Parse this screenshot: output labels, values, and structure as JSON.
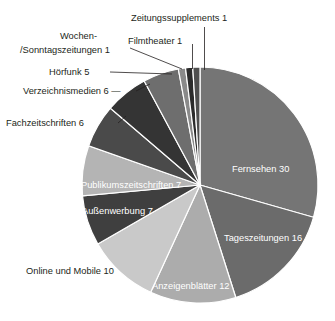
{
  "chart_data": {
    "type": "pie",
    "title": "",
    "subtitle": "",
    "xlabel": "",
    "ylabel": "",
    "total": 102,
    "legend_position": "none",
    "grid": false,
    "label_format": "name value",
    "start_angle_deg": 0,
    "direction": "clockwise",
    "categories": [
      "Fernsehen",
      "Tageszeitungen",
      "Anzeigenblätter",
      "Online und Mobile",
      "Außenwerbung",
      "Publikumszeitschriften",
      "Fachzeitschriften",
      "Verzeichnismedien",
      "Hörfunk",
      "Wochen-/Sonntagszeitungen",
      "Filmtheater",
      "Zeitungssupplements"
    ],
    "values": [
      30,
      16,
      12,
      10,
      7,
      7,
      6,
      6,
      5,
      1,
      1,
      1
    ],
    "slices": [
      {
        "name": "Fernsehen",
        "value": 30,
        "label": "Fernsehen 30",
        "color": "#757575",
        "label_placement": "inside",
        "label_color": "#ffffff"
      },
      {
        "name": "Tageszeitungen",
        "value": 16,
        "label": "Tageszeitungen 16",
        "color": "#6b6b6b",
        "label_placement": "inside",
        "label_color": "#ffffff"
      },
      {
        "name": "Anzeigenblätter",
        "value": 12,
        "label": "Anzeigenblätter 12",
        "color": "#acacac",
        "label_placement": "inside",
        "label_color": "#ffffff"
      },
      {
        "name": "Online und Mobile",
        "value": 10,
        "label": "Online und Mobile 10",
        "color": "#c9c9c9",
        "label_placement": "outside",
        "label_color": "#231f20"
      },
      {
        "name": "Außenwerbung",
        "value": 7,
        "label": "Außenwerbung 7",
        "color": "#3f3f3f",
        "label_placement": "inside",
        "label_color": "#ffffff"
      },
      {
        "name": "Publikumszeitschriften",
        "value": 7,
        "label": "Publikumszeitschriften 7",
        "color": "#b4b4b4",
        "label_placement": "inside",
        "label_color": "#ffffff"
      },
      {
        "name": "Fachzeitschriften",
        "value": 6,
        "label": "Fachzeitschriften 6",
        "color": "#4a4a4a",
        "label_placement": "outside",
        "label_color": "#231f20"
      },
      {
        "name": "Verzeichnismedien",
        "value": 6,
        "label": "Verzeichnismedien 6",
        "color": "#343434",
        "label_placement": "outside",
        "label_color": "#231f20"
      },
      {
        "name": "Hörfunk",
        "value": 5,
        "label": "Hörfunk 5",
        "color": "#6e6e6e",
        "label_placement": "outside",
        "label_color": "#231f20"
      },
      {
        "name": "Wochen-/Sonntagszeitungen",
        "value": 1,
        "label": "Wochen-/Sonntagszeitungen 1",
        "label_line1": "Wochen-",
        "label_line2": "/Sonntagszeitungen 1",
        "color": "#8a8a8a",
        "label_placement": "outside",
        "label_color": "#231f20"
      },
      {
        "name": "Filmtheater",
        "value": 1,
        "label": "Filmtheater 1",
        "color": "#2b2b2b",
        "label_placement": "outside",
        "label_color": "#231f20"
      },
      {
        "name": "Zeitungssupplements",
        "value": 1,
        "label": "Zeitungssupplements 1",
        "color": "#4f4f4f",
        "label_placement": "outside",
        "label_color": "#231f20"
      }
    ]
  },
  "labels": {
    "fernsehen": "Fernsehen 30",
    "tageszeitungen": "Tageszeitungen 16",
    "anzeigenblaetter": "Anzeigenblätter 12",
    "online_und_mobile": "Online und Mobile 10",
    "aussenwerbung": "Außenwerbung 7",
    "publikumszeitschriften": "Publikumszeitschriften 7",
    "fachzeitschriften": "Fachzeitschriften 6",
    "verzeichnismedien": "Verzeichnismedien 6 —",
    "hoerfunk": "Hörfunk 5",
    "wochenzeitungen_line1": "Wochen-",
    "wochenzeitungen_line2": "/Sonntagszeitungen 1",
    "filmtheater": "Filmtheater 1",
    "zeitungssupplements": "Zeitungssupplements 1"
  }
}
